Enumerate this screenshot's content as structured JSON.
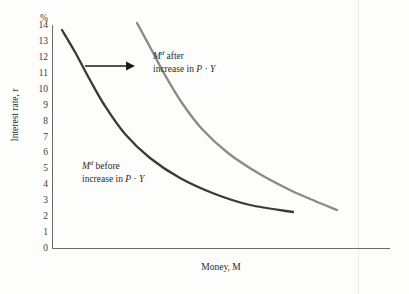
{
  "chart_data": {
    "type": "line",
    "title": "",
    "xlabel": "Money, M",
    "ylabel": "Interest rate, r",
    "y_unit_symbol": "%",
    "ylim": [
      0,
      14
    ],
    "grid": false,
    "legend_position": "inline-annotations",
    "yticks": [
      "14",
      "13",
      "12",
      "11",
      "10",
      "9",
      "8",
      "7",
      "6",
      "5",
      "4",
      "3",
      "2",
      "1",
      "0"
    ],
    "xticks": [],
    "series": [
      {
        "name": "Md before increase in P · Y",
        "color": "#3a3a3a",
        "points": [
          [
            62,
            30
          ],
          [
            75,
            52
          ],
          [
            90,
            80
          ],
          [
            105,
            106
          ],
          [
            125,
            134
          ],
          [
            150,
            158
          ],
          [
            180,
            178
          ],
          [
            215,
            194
          ],
          [
            250,
            205
          ],
          [
            293,
            212
          ]
        ]
      },
      {
        "name": "Md after increase in P · Y",
        "color": "#8a8a8a",
        "points": [
          [
            137,
            23
          ],
          [
            150,
            47
          ],
          [
            165,
            75
          ],
          [
            182,
            103
          ],
          [
            202,
            129
          ],
          [
            228,
            153
          ],
          [
            258,
            173
          ],
          [
            290,
            190
          ],
          [
            315,
            201
          ],
          [
            337,
            210
          ]
        ]
      }
    ],
    "annotations": [
      {
        "id": "after",
        "line1_prefix": "M",
        "line1_sup": "d",
        "line1_suffix": " after",
        "line2_prefix": "increase in ",
        "line2_p": "P",
        "line2_dot": " · ",
        "line2_y": "Y"
      },
      {
        "id": "before",
        "line1_prefix": "M",
        "line1_sup": "d",
        "line1_suffix": " before",
        "line2_prefix": "increase in ",
        "line2_p": "P",
        "line2_dot": " · ",
        "line2_y": "Y"
      }
    ],
    "shift_arrow": {
      "name": "rightward-shift-arrow",
      "x_start": 85,
      "x_end": 135,
      "y": 66,
      "color": "#1a1a1a"
    }
  },
  "axes": {
    "y_symbol": "%",
    "y_title": "Interest rate, r",
    "x_title": "Money, M",
    "y_origin_label": "0"
  }
}
